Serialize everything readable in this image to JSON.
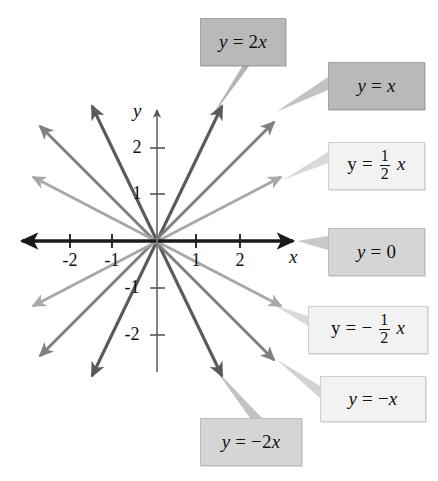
{
  "figure": {
    "background": "#ffffff"
  },
  "axes": {
    "x_label": "x",
    "y_label": "y",
    "x_ticks": [
      "-2",
      "-1",
      "1",
      "2"
    ],
    "y_ticks": [
      "2",
      "1",
      "-1",
      "-2"
    ],
    "x_range": [
      -2.9,
      2.9
    ],
    "y_range": [
      -2.9,
      2.9
    ],
    "axis_color": "#1a1a1a",
    "grid": false
  },
  "colors": {
    "steep": "#5a5a5a",
    "unit": "#808080",
    "shallow": "#a8a8a8",
    "box_dark": "#b9b9b9",
    "box_mid": "#d5d5d5",
    "box_light": "#f2f2f2"
  },
  "callouts": {
    "y2x": {
      "text": "y = 2x",
      "style": "dark"
    },
    "yx": {
      "text": "y = x",
      "style": "dark"
    },
    "yhalf": {
      "lhs": "y =",
      "num": "1",
      "den": "2",
      "var": "x",
      "style": "light"
    },
    "y0": {
      "text": "y = 0",
      "style": "mid"
    },
    "ymhalf": {
      "lhs": "y = −",
      "num": "1",
      "den": "2",
      "var": "x",
      "style": "light"
    },
    "ymx": {
      "text": "y = −x",
      "style": "light"
    },
    "ym2x": {
      "text": "y = −2x",
      "style": "mid"
    }
  },
  "chart_data": {
    "type": "line",
    "xlabel": "x",
    "ylabel": "y",
    "xlim": [
      -2.9,
      2.9
    ],
    "ylim": [
      -2.9,
      2.9
    ],
    "xticks": [
      -2,
      -1,
      1,
      2
    ],
    "yticks": [
      2,
      1,
      -1,
      -2
    ],
    "grid": false,
    "legend": "callout-boxes",
    "series": [
      {
        "name": "y = 2x",
        "slope": 2,
        "color": "#5a5a5a",
        "x": [
          -1.45,
          1.45
        ],
        "y": [
          -2.9,
          2.9
        ],
        "arrows": "both"
      },
      {
        "name": "y = x",
        "slope": 1,
        "color": "#808080",
        "x": [
          -2.6,
          2.6
        ],
        "y": [
          -2.6,
          2.6
        ],
        "arrows": "both"
      },
      {
        "name": "y = 1/2 x",
        "slope": 0.5,
        "color": "#a8a8a8",
        "x": [
          -2.75,
          2.75
        ],
        "y": [
          -1.375,
          1.375
        ],
        "arrows": "both"
      },
      {
        "name": "y = 0",
        "slope": 0,
        "color": "#1a1a1a",
        "x": [
          -2.9,
          2.9
        ],
        "y": [
          0,
          0
        ],
        "arrows": "both"
      },
      {
        "name": "y = -1/2 x",
        "slope": -0.5,
        "color": "#a8a8a8",
        "x": [
          -2.75,
          2.75
        ],
        "y": [
          1.375,
          -1.375
        ],
        "arrows": "both"
      },
      {
        "name": "y = -x",
        "slope": -1,
        "color": "#808080",
        "x": [
          -2.6,
          2.6
        ],
        "y": [
          2.6,
          -2.6
        ],
        "arrows": "both"
      },
      {
        "name": "y = -2x",
        "slope": -2,
        "color": "#5a5a5a",
        "x": [
          -1.45,
          1.45
        ],
        "y": [
          2.9,
          -2.9
        ],
        "arrows": "both"
      }
    ]
  }
}
